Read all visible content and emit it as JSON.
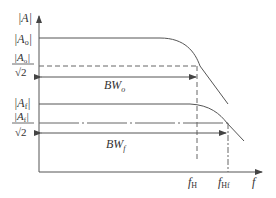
{
  "diagram": {
    "y_axis": {
      "label": "|A|"
    },
    "x_axis": {
      "label": "f"
    },
    "levels": {
      "open_loop_gain": "|A",
      "open_loop_gain_sub": "o",
      "open_loop_halfpower_num": "|A",
      "open_loop_halfpower_sub": "o",
      "open_loop_halfpower_den": "√2",
      "feedback_gain": "|A",
      "feedback_gain_sub": "f",
      "feedback_halfpower_num": "|A",
      "feedback_halfpower_sub": "f",
      "feedback_halfpower_den": "√2"
    },
    "bandwidths": {
      "open_loop": {
        "label": "BW",
        "sub": "o"
      },
      "feedback": {
        "label": "BW",
        "sub": "f"
      }
    },
    "frequencies": {
      "f_H": {
        "label": "f",
        "sub": "H"
      },
      "f_Hf": {
        "label": "f",
        "sub": "Hf"
      }
    },
    "colors": {
      "line": "#555555",
      "text": "#333333"
    }
  }
}
